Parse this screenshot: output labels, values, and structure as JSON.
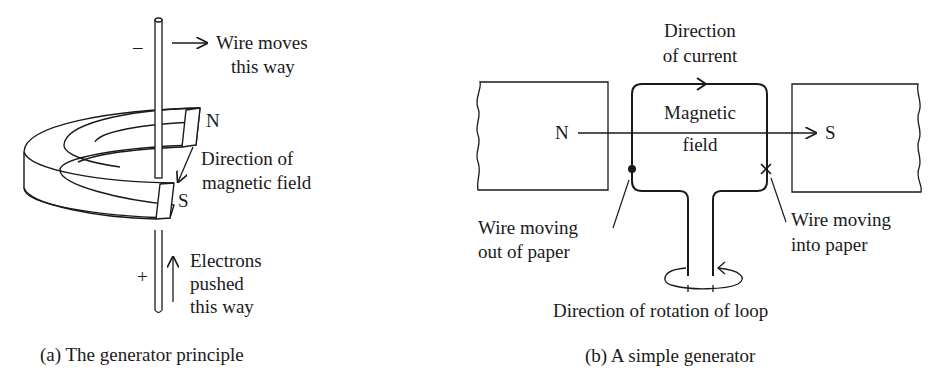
{
  "panel_a": {
    "labels": {
      "minus": "–",
      "plus": "+",
      "wire_moves_1": "Wire moves",
      "wire_moves_2": "this way",
      "north": "N",
      "south": "S",
      "field_1": "Direction of",
      "field_2": "magnetic field",
      "electrons_1": "Electrons",
      "electrons_2": "pushed",
      "electrons_3": "this way"
    },
    "caption": "(a)  The generator principle"
  },
  "panel_b": {
    "labels": {
      "current_1": "Direction",
      "current_2": "of current",
      "north": "N",
      "south": "S",
      "field_1": "Magnetic",
      "field_2": "field",
      "out_1": "Wire moving",
      "out_2": "out of paper",
      "in_1": "Wire moving",
      "in_2": "into paper",
      "rotation": "Direction of rotation of loop"
    },
    "caption": "(b) A simple generator"
  },
  "colors": {
    "ink": "#1a1a1a",
    "background": "#ffffff"
  }
}
